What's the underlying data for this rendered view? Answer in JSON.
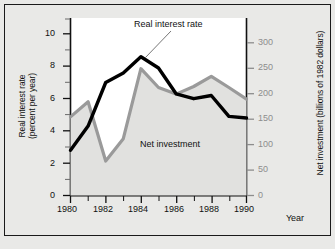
{
  "chart_data": {
    "type": "line",
    "title": "",
    "xlabel": "Year",
    "x": [
      1980,
      1981,
      1982,
      1983,
      1984,
      1985,
      1986,
      1987,
      1988,
      1989,
      1990
    ],
    "xlim": [
      1980,
      1990
    ],
    "x_tick_labels": [
      "1980",
      "1982",
      "1984",
      "1986",
      "1988",
      "1990"
    ],
    "x_tick_values": [
      1980,
      1982,
      1984,
      1986,
      1988,
      1990
    ],
    "x_minor_tick_values": [
      1981,
      1983,
      1985,
      1987,
      1989
    ],
    "grid": false,
    "legend_position": "inline-annotation",
    "axes": [
      {
        "id": "left",
        "label": "Real interest rate (percent per year)",
        "label_line1": "Real interest rate",
        "label_line2": "(percent per year)",
        "unit": "percent per year",
        "lim": [
          0,
          11
        ],
        "ticks": [
          0,
          2,
          4,
          6,
          8,
          10
        ],
        "tick_labels": [
          "0",
          "2",
          "4",
          "6",
          "8",
          "10"
        ],
        "minor_ticks": [
          1,
          3,
          5,
          7,
          9,
          11
        ],
        "color": "#111111"
      },
      {
        "id": "right",
        "label": "Net investment (billions of 1982 dollars)",
        "unit": "billions of 1982 dollars",
        "lim": [
          0,
          350
        ],
        "ticks": [
          0,
          50,
          100,
          150,
          200,
          250,
          300
        ],
        "tick_labels": [
          "0",
          "50",
          "100",
          "150",
          "200",
          "250",
          "300"
        ],
        "color": "#8d8d8d"
      }
    ],
    "series": [
      {
        "name": "Real interest rate",
        "axis": "left",
        "color": "#000000",
        "values": [
          2.8,
          4.3,
          7.0,
          7.6,
          8.6,
          7.9,
          6.3,
          6.0,
          6.2,
          4.9,
          4.8
        ]
      },
      {
        "name": "Net investment",
        "axis": "right",
        "color": "#9a9a9a",
        "values": [
          155,
          185,
          68,
          112,
          250,
          213,
          200,
          215,
          235,
          213,
          190
        ]
      }
    ],
    "annotations": [
      {
        "name": "real-interest-rate-callout",
        "text": "Real interest rate",
        "points_to": {
          "x": 1984,
          "y": 8.6,
          "axis": "left"
        }
      },
      {
        "name": "net-investment-callout",
        "text": "Net investment",
        "points_to": null
      }
    ]
  }
}
